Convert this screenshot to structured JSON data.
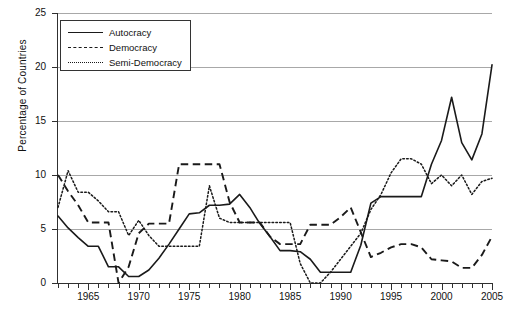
{
  "chart_data": {
    "type": "line",
    "title": "",
    "xlabel": "",
    "ylabel": "Percentage of Countries",
    "xlim": [
      1962,
      2005
    ],
    "ylim": [
      0,
      25
    ],
    "yticks": [
      0,
      5,
      10,
      15,
      20,
      25
    ],
    "xticks": [
      1965,
      1970,
      1975,
      1980,
      1985,
      1990,
      1995,
      2000,
      2005
    ],
    "xtick_step": 1,
    "grid": "horizontal",
    "legend_position": "top-left",
    "x": [
      1962,
      1963,
      1964,
      1965,
      1966,
      1967,
      1968,
      1969,
      1970,
      1971,
      1972,
      1973,
      1974,
      1975,
      1976,
      1977,
      1978,
      1979,
      1980,
      1981,
      1982,
      1983,
      1984,
      1985,
      1986,
      1987,
      1988,
      1989,
      1990,
      1991,
      1992,
      1993,
      1994,
      1995,
      1996,
      1997,
      1998,
      1999,
      2000,
      2001,
      2002,
      2003,
      2004,
      2005
    ],
    "series": [
      {
        "name": "Autocracy",
        "style": "solid",
        "values": [
          6.2,
          5.1,
          4.2,
          3.4,
          3.4,
          1.5,
          1.5,
          0.6,
          0.6,
          1.2,
          2.3,
          3.6,
          5.0,
          6.4,
          6.5,
          7.2,
          7.2,
          7.3,
          8.2,
          7.0,
          5.5,
          4.3,
          3.0,
          3.0,
          2.9,
          2.2,
          1.0,
          1.0,
          1.0,
          1.0,
          3.5,
          7.4,
          8.0,
          8.0,
          8.0,
          8.0,
          8.0,
          11.0,
          13.2,
          17.2,
          13.0,
          11.4,
          13.8,
          20.2
        ]
      },
      {
        "name": "Democracy",
        "style": "dashed",
        "values": [
          10.0,
          8.5,
          7.2,
          5.6,
          5.6,
          5.6,
          0.0,
          1.5,
          4.6,
          5.5,
          5.5,
          5.5,
          11.0,
          11.0,
          11.0,
          11.0,
          11.0,
          7.5,
          5.6,
          5.6,
          5.6,
          4.3,
          3.6,
          3.6,
          3.6,
          5.4,
          5.4,
          5.4,
          6.1,
          7.0,
          4.7,
          2.4,
          2.8,
          3.3,
          3.6,
          3.6,
          3.3,
          2.2,
          2.1,
          2.0,
          1.4,
          1.4,
          2.6,
          4.3
        ]
      },
      {
        "name": "Semi-Democracy",
        "style": "dotted",
        "values": [
          7.0,
          10.4,
          8.4,
          8.4,
          7.6,
          6.6,
          6.6,
          4.4,
          5.8,
          4.4,
          3.4,
          3.4,
          3.4,
          3.4,
          3.4,
          9.0,
          6.0,
          5.6,
          5.6,
          5.6,
          5.6,
          5.6,
          5.6,
          5.6,
          1.8,
          0.0,
          0.0,
          1.0,
          2.2,
          3.4,
          4.6,
          6.8,
          8.2,
          10.2,
          11.5,
          11.5,
          11.0,
          9.2,
          10.0,
          9.0,
          10.0,
          8.2,
          9.4,
          9.7
        ]
      }
    ]
  },
  "legend": {
    "items": [
      {
        "label": "Autocracy",
        "style": "solid"
      },
      {
        "label": "Democracy",
        "style": "dashed"
      },
      {
        "label": "Semi-Democracy",
        "style": "dotted"
      }
    ]
  },
  "axes": {
    "y_title": "Percentage of Countries",
    "y_labels": [
      "25",
      "20",
      "15",
      "10",
      "5",
      "0"
    ],
    "x_labels": [
      "1965",
      "1970",
      "1975",
      "1980",
      "1985",
      "1990",
      "1995",
      "2000",
      "2005"
    ]
  }
}
